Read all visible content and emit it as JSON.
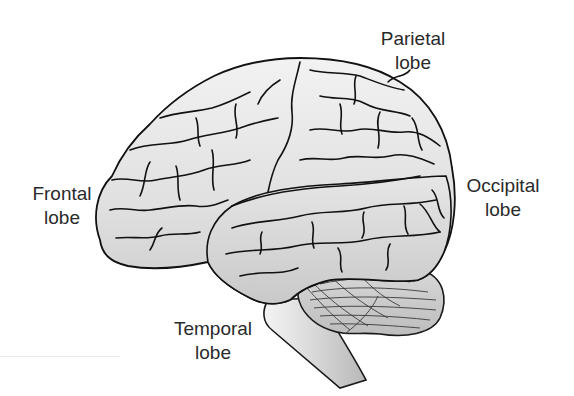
{
  "diagram": {
    "labels": [
      {
        "id": "parietal",
        "line1": "Parietal",
        "line2": "lobe"
      },
      {
        "id": "frontal",
        "line1": "Frontal",
        "line2": "lobe"
      },
      {
        "id": "occipital",
        "line1": "Occipital",
        "line2": "lobe"
      },
      {
        "id": "temporal",
        "line1": "Temporal",
        "line2": "lobe"
      }
    ],
    "colors": {
      "brain_fill": "#dcdcdc",
      "brain_fill_light": "#ececec",
      "outline": "#111111",
      "cerebellum_fill": "#cfcfcf",
      "brainstem_fill": "#d6d6d6",
      "label_text": "#2a2a2a",
      "background": "#ffffff"
    }
  }
}
